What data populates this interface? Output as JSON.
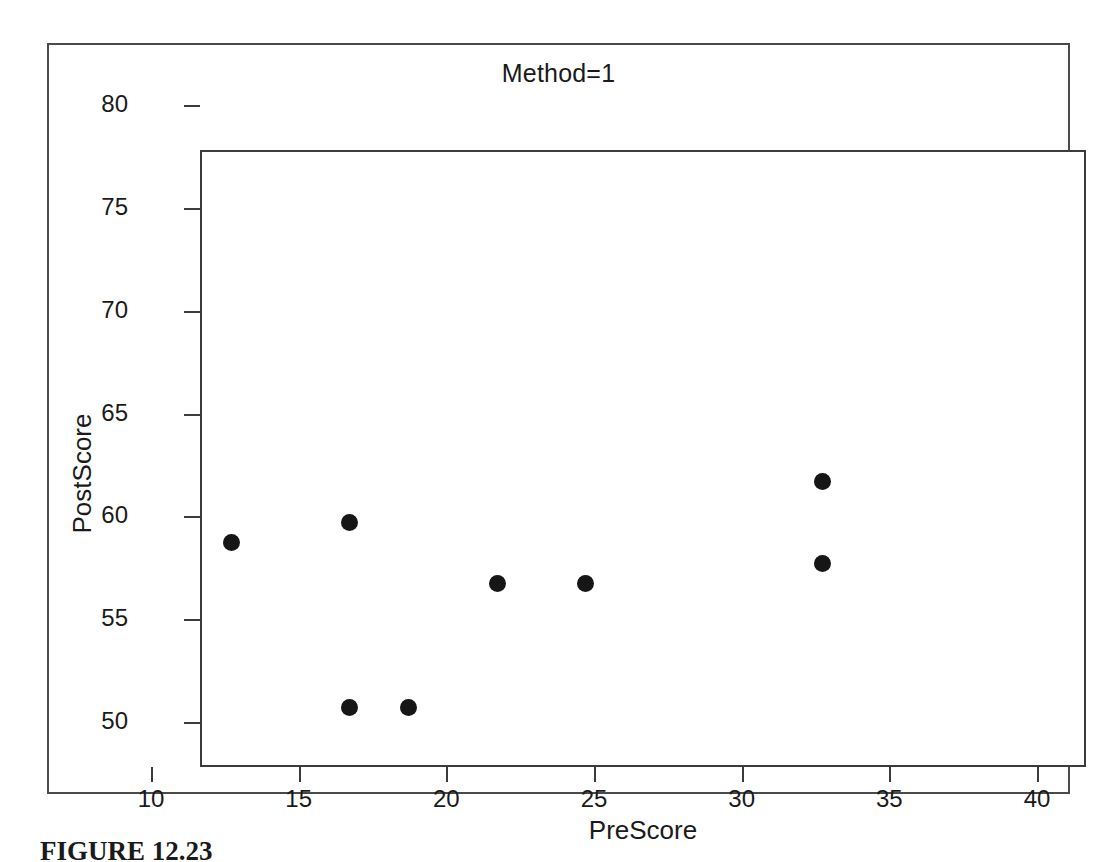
{
  "figure": {
    "caption": "FIGURE 12.23"
  },
  "chart_data": {
    "type": "scatter",
    "title": "Method=1",
    "xlabel": "PreScore",
    "ylabel": "PostScore",
    "xlim": [
      10,
      40
    ],
    "ylim": [
      50,
      80
    ],
    "xticks": [
      10,
      15,
      20,
      25,
      30,
      35,
      40
    ],
    "yticks": [
      50,
      55,
      60,
      65,
      70,
      75,
      80
    ],
    "grid": false,
    "legend": null,
    "marker": "filled-circle",
    "marker_color": "#161616",
    "series": [
      {
        "name": "Method=1",
        "points": [
          {
            "x": 11,
            "y": 61
          },
          {
            "x": 15,
            "y": 62
          },
          {
            "x": 15,
            "y": 53
          },
          {
            "x": 17,
            "y": 53
          },
          {
            "x": 20,
            "y": 59
          },
          {
            "x": 23,
            "y": 59
          },
          {
            "x": 31,
            "y": 64
          },
          {
            "x": 31,
            "y": 60
          }
        ]
      }
    ]
  },
  "colors": {
    "axis": "#3b3b3b",
    "frame": "#4a4a4a",
    "marker": "#161616",
    "text": "#1a1a1a",
    "background": "#ffffff"
  }
}
